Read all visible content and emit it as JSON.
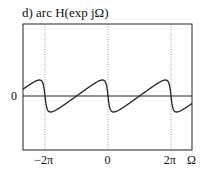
{
  "chart_data": {
    "type": "line",
    "title": "d) arc H(exp jΩ)",
    "xlabel": "Ω",
    "ylabel": "",
    "x_ticks": [
      {
        "label": "−2π",
        "value": -6.2832
      },
      {
        "label": "0",
        "value": 0
      },
      {
        "label": "2π",
        "value": 6.2832
      }
    ],
    "y_ticks": [
      {
        "label": "0",
        "value": 0
      }
    ],
    "xlim": [
      -8.48,
      8.38
    ],
    "ylim": [
      -2.2,
      2.5
    ],
    "grid": "dotted vertical lines at x ticks",
    "series": [
      {
        "name": "arc H(exp jΩ)",
        "description": "periodic phase response, rises slowly then drops sharply at multiples of 2π",
        "x": [
          -8.48,
          -7.5,
          -7.0,
          -6.6,
          -6.4,
          -6.2832,
          -6.15,
          -5.9,
          -5.5,
          -4.5,
          -3.1416,
          -1.5,
          -0.8,
          -0.35,
          -0.12,
          0,
          0.12,
          0.35,
          0.8,
          1.5,
          3.1416,
          4.5,
          5.5,
          5.9,
          6.15,
          6.2832,
          6.4,
          6.6,
          7.0,
          7.5,
          8.38
        ],
        "values": [
          0.32,
          0.62,
          0.85,
          1.0,
          0.7,
          0,
          -0.7,
          -1.0,
          -0.92,
          -0.6,
          0,
          0.6,
          0.92,
          1.0,
          0.7,
          0,
          -0.7,
          -1.0,
          -0.92,
          -0.6,
          0,
          0.6,
          0.92,
          1.0,
          0.7,
          0,
          -0.7,
          -1.0,
          -0.85,
          -0.62,
          -0.32
        ]
      }
    ]
  }
}
